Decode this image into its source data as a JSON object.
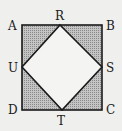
{
  "diagram": {
    "vertices": {
      "A": "A",
      "B": "B",
      "C": "C",
      "D": "D",
      "R": "R",
      "S": "S",
      "T": "T",
      "U": "U"
    },
    "colors": {
      "background": "#efefed",
      "shade": "#a9a9a9",
      "stroke": "#1a1a1a",
      "inner": "#f4f4f2"
    }
  }
}
